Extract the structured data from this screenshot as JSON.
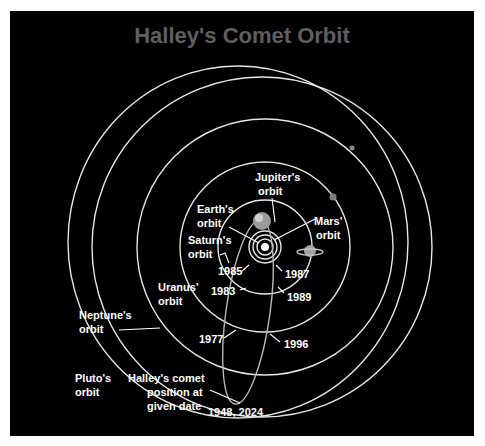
{
  "title": "Halley's Comet Orbit",
  "labels": {
    "jupiter": [
      "Jupiter's",
      "orbit"
    ],
    "earth": [
      "Earth's",
      "orbit"
    ],
    "mars": [
      "Mars'",
      "orbit"
    ],
    "saturn": [
      "Saturn's",
      "orbit"
    ],
    "uranus": [
      "Uranus'",
      "orbit"
    ],
    "neptune": [
      "Neptune's",
      "orbit"
    ],
    "pluto": [
      "Pluto's",
      "orbit"
    ],
    "comet": [
      "Halley's comet",
      "position at",
      "given date"
    ]
  },
  "dates": {
    "d1985": "1985",
    "d1987": "1987",
    "d1983": "1983",
    "d1989": "1989",
    "d1977": "1977",
    "d1996": "1996",
    "d1948": "1948, 2024"
  },
  "colors": {
    "background": "#000000",
    "title": "#5f5f5f",
    "orbit": "#e6e6e6",
    "text": "#ffffff"
  }
}
